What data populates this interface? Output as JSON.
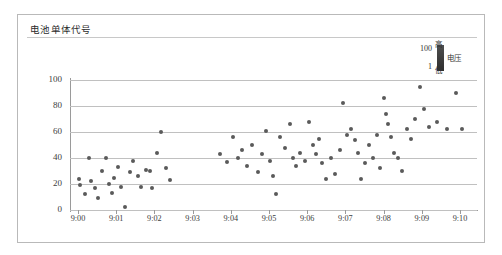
{
  "chart_title": "电池单体代号",
  "legend": {
    "title": "电压",
    "top_value": "100",
    "bottom_value": "1",
    "top_label": "高",
    "bottom_label": "低",
    "gradient_high_color": "#2e2e2e",
    "gradient_low_color": "#4f4f4f"
  },
  "marker_color": "#5a5a5a",
  "grid_color": "#c0c0c0",
  "axis_color": "#9a9a9a",
  "frame_color": "#b9b9b9",
  "chart_data": {
    "type": "scatter",
    "title": "电池单体代号",
    "xlabel": "",
    "ylabel": "",
    "xlim": [
      0,
      10.6
    ],
    "ylim": [
      -3,
      108
    ],
    "grid": true,
    "legend_position": "top-right",
    "xtick_labels": [
      "9:00",
      "9:01",
      "9:02",
      "9:03",
      "9:04",
      "9:05",
      "9:06",
      "9:07",
      "9:08",
      "9:09",
      "9:10"
    ],
    "xtick_values": [
      0,
      1,
      2,
      3,
      4,
      5,
      6,
      7,
      8,
      9,
      10
    ],
    "ytick_labels": [
      "0",
      "20",
      "40",
      "60",
      "80",
      "100"
    ],
    "ytick_values": [
      0,
      20,
      40,
      60,
      80,
      100
    ],
    "series": [
      {
        "name": "电池单体代号",
        "points": [
          [
            0.02,
            24
          ],
          [
            0.05,
            19
          ],
          [
            0.18,
            12
          ],
          [
            0.3,
            40
          ],
          [
            0.34,
            22
          ],
          [
            0.45,
            17
          ],
          [
            0.52,
            9
          ],
          [
            0.62,
            30
          ],
          [
            0.72,
            40
          ],
          [
            0.8,
            20
          ],
          [
            0.88,
            13
          ],
          [
            0.95,
            25
          ],
          [
            1.05,
            33
          ],
          [
            1.12,
            18
          ],
          [
            1.22,
            2
          ],
          [
            1.35,
            29
          ],
          [
            1.45,
            38
          ],
          [
            1.58,
            26
          ],
          [
            1.66,
            18
          ],
          [
            1.78,
            31
          ],
          [
            1.88,
            30
          ],
          [
            1.95,
            17
          ],
          [
            2.08,
            44
          ],
          [
            2.18,
            60
          ],
          [
            2.3,
            32
          ],
          [
            2.42,
            23
          ],
          [
            3.72,
            43
          ],
          [
            3.9,
            37
          ],
          [
            4.05,
            56
          ],
          [
            4.18,
            40
          ],
          [
            4.3,
            46
          ],
          [
            4.42,
            34
          ],
          [
            4.55,
            50
          ],
          [
            4.7,
            29
          ],
          [
            4.82,
            43
          ],
          [
            4.92,
            61
          ],
          [
            5.02,
            38
          ],
          [
            5.1,
            26
          ],
          [
            5.18,
            12
          ],
          [
            5.3,
            56
          ],
          [
            5.42,
            48
          ],
          [
            5.55,
            66
          ],
          [
            5.62,
            40
          ],
          [
            5.7,
            34
          ],
          [
            5.82,
            44
          ],
          [
            5.95,
            38
          ],
          [
            6.05,
            68
          ],
          [
            6.15,
            50
          ],
          [
            6.22,
            43
          ],
          [
            6.32,
            55
          ],
          [
            6.4,
            36
          ],
          [
            6.5,
            24
          ],
          [
            6.62,
            40
          ],
          [
            6.72,
            28
          ],
          [
            6.85,
            46
          ],
          [
            6.95,
            82
          ],
          [
            7.05,
            58
          ],
          [
            7.15,
            62
          ],
          [
            7.25,
            54
          ],
          [
            7.32,
            44
          ],
          [
            7.42,
            24
          ],
          [
            7.52,
            36
          ],
          [
            7.62,
            50
          ],
          [
            7.72,
            40
          ],
          [
            7.82,
            58
          ],
          [
            7.9,
            32
          ],
          [
            8.0,
            86
          ],
          [
            8.05,
            74
          ],
          [
            8.12,
            66
          ],
          [
            8.2,
            56
          ],
          [
            8.28,
            44
          ],
          [
            8.38,
            40
          ],
          [
            8.48,
            30
          ],
          [
            8.6,
            62
          ],
          [
            8.72,
            55
          ],
          [
            8.82,
            70
          ],
          [
            8.95,
            95
          ],
          [
            9.05,
            78
          ],
          [
            9.2,
            64
          ],
          [
            9.4,
            68
          ],
          [
            9.65,
            62
          ],
          [
            9.9,
            90
          ],
          [
            10.05,
            62
          ]
        ]
      }
    ]
  }
}
